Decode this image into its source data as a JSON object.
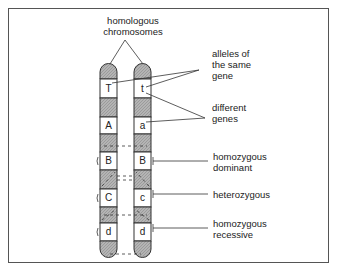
{
  "title": [
    "homologous",
    "chromosomes"
  ],
  "left_chromosome": {
    "alleles": [
      "T",
      "A",
      "B",
      "C",
      "d"
    ]
  },
  "right_chromosome": {
    "alleles": [
      "t",
      "a",
      "B",
      "c",
      "d"
    ]
  },
  "labels": {
    "alleles_same_gene": [
      "alleles of",
      "the same",
      "gene"
    ],
    "different_genes": [
      "different",
      "genes"
    ],
    "homozygous_dominant": [
      "homozygous",
      "dominant"
    ],
    "heterozygous": [
      "heterozygous"
    ],
    "homozygous_recessive": [
      "homozygous",
      "recessive"
    ]
  },
  "colors": {
    "band_fill": "#b0b0b0",
    "outline": "#333333",
    "frame": "#555555"
  }
}
